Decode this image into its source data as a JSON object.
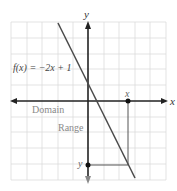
{
  "diagram": {
    "function_label": "f(x) = −2x + 1",
    "axis_labels": {
      "x": "x",
      "y": "y"
    },
    "region_labels": {
      "domain": "Domain",
      "range": "Range"
    },
    "point_labels": {
      "x": "x",
      "y": "y"
    },
    "equation": {
      "slope": -2,
      "intercept": 1
    },
    "colors": {
      "grid": "#dcdcdc",
      "axis": "#222222",
      "line": "#4a4a4a",
      "label_gray": "#8a8a8a"
    }
  }
}
